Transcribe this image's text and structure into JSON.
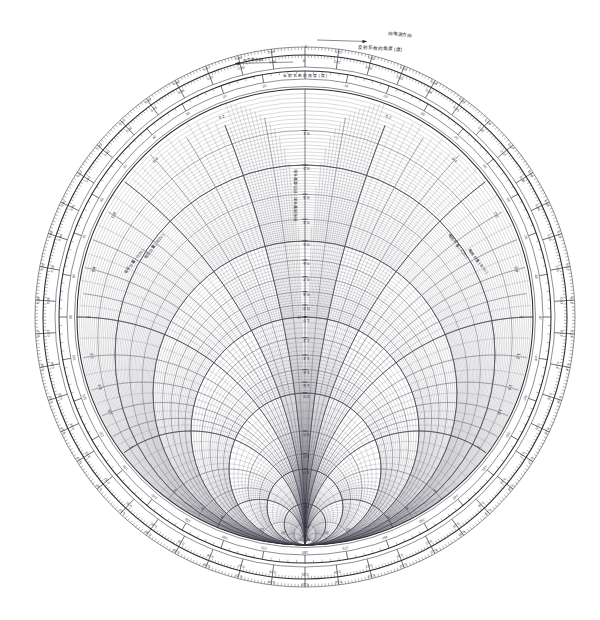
{
  "orientation": "rotated-90-ccw",
  "background_color": "#ffffff",
  "line_color": "#4a4a54",
  "rim_color": "#2a2a31",
  "geometry": {
    "center_x": 305,
    "center_y": 317,
    "chart_radius": 228,
    "ring_wavelength_outer_radius": 262,
    "ring_wavelength_inner_radius": 250,
    "ring_angle_radius": 238,
    "rotation_deg": -90
  },
  "annotations": {
    "top_scale_label": "反射系数的角度 (度)",
    "top_outer_arrow_label": "向电源方向",
    "top_inner_arrow_label": "向负载方向",
    "left_inner_label": "电阻分量 ( R/Zo ) 或 电导分量 ( G/Yo )",
    "right_inner_label": "电抗分量 ( X/Zo ) 或 电纳分量 ( B/Yo )",
    "center_origin": "O",
    "wavelength_outer_name": "向电源波长数",
    "wavelength_inner_name": "向负载波长数",
    "top_zero": "0",
    "top_left_val": "0.49",
    "top_right_val": "0.01"
  },
  "chart_data": {
    "type": "smith-chart",
    "normalization": "Zo = 1",
    "xlabel": "电阻分量 ( R/Zo )",
    "ylabel": "电抗分量 ( X/Zo )",
    "grid": true,
    "legend_position": "none",
    "resistance_circles_major": [
      0.1,
      0.2,
      0.3,
      0.4,
      0.5,
      0.6,
      0.7,
      0.8,
      0.9,
      1.0,
      1.2,
      1.4,
      1.6,
      1.8,
      2.0,
      3.0,
      4.0,
      5.0,
      10,
      20,
      50
    ],
    "resistance_circles_fine_bands": [
      {
        "from": 0.0,
        "to": 0.2,
        "step": 0.01
      },
      {
        "from": 0.2,
        "to": 0.5,
        "step": 0.01
      },
      {
        "from": 0.5,
        "to": 1.0,
        "step": 0.02
      },
      {
        "from": 1.0,
        "to": 2.0,
        "step": 0.05
      },
      {
        "from": 2.0,
        "to": 5.0,
        "step": 0.2
      },
      {
        "from": 5.0,
        "to": 20.0,
        "step": 1.0
      }
    ],
    "reactance_arcs_major": [
      0.1,
      0.2,
      0.3,
      0.4,
      0.5,
      0.6,
      0.7,
      0.8,
      0.9,
      1.0,
      1.2,
      1.4,
      1.6,
      1.8,
      2.0,
      3.0,
      4.0,
      5.0,
      10,
      20,
      50
    ],
    "axis_tick_labels": [
      "0.1",
      "0.2",
      "0.3",
      "0.4",
      "0.5",
      "0.6",
      "0.7",
      "0.8",
      "0.9",
      "1.0",
      "1.2",
      "1.4",
      "1.6",
      "1.8",
      "2.0",
      "3.0",
      "4.0",
      "5.0",
      "10",
      "20",
      "50"
    ],
    "reactance_labels_right": [
      "0.2",
      "0.4",
      "0.6",
      "0.8",
      "1.0",
      "1.2",
      "1.4",
      "1.6",
      "2.0",
      "3.0",
      "4.0",
      "5.0",
      "10",
      "20"
    ],
    "reactance_labels_left": [
      "0.2",
      "0.4",
      "0.6",
      "0.8",
      "1.0",
      "1.2",
      "1.4",
      "1.6",
      "2.0",
      "3.0",
      "4.0",
      "5.0",
      "10",
      "20"
    ],
    "angle_scale_deg": [
      0,
      10,
      20,
      30,
      40,
      50,
      60,
      70,
      80,
      90,
      100,
      110,
      120,
      130,
      140,
      150,
      160,
      170,
      180,
      -170,
      -160,
      -150,
      -140,
      -130,
      -120,
      -110,
      -100,
      -90,
      -80,
      -70,
      -60,
      -50,
      -40,
      -30,
      -20,
      -10
    ],
    "wavelength_scale_toward_generator": [
      "0.0",
      "0.01",
      "0.02",
      "0.03",
      "0.04",
      "0.05",
      "0.06",
      "0.07",
      "0.08",
      "0.09",
      "0.10",
      "0.11",
      "0.12",
      "0.13",
      "0.14",
      "0.15",
      "0.16",
      "0.17",
      "0.18",
      "0.19",
      "0.20",
      "0.21",
      "0.22",
      "0.23",
      "0.24",
      "0.25",
      "0.26",
      "0.27",
      "0.28",
      "0.29",
      "0.30",
      "0.31",
      "0.32",
      "0.33",
      "0.34",
      "0.35",
      "0.36",
      "0.37",
      "0.38",
      "0.39",
      "0.40",
      "0.41",
      "0.42",
      "0.43",
      "0.44",
      "0.45",
      "0.46",
      "0.47",
      "0.48",
      "0.49"
    ],
    "wavelength_scale_toward_load": [
      "0.0",
      "0.49",
      "0.48",
      "0.47",
      "0.46",
      "0.45",
      "0.44",
      "0.43",
      "0.42",
      "0.41",
      "0.40",
      "0.39",
      "0.38",
      "0.37",
      "0.36",
      "0.35",
      "0.34",
      "0.33",
      "0.32",
      "0.31",
      "0.30",
      "0.29",
      "0.28",
      "0.27",
      "0.26",
      "0.25",
      "0.24",
      "0.23",
      "0.22",
      "0.21",
      "0.20",
      "0.19",
      "0.18",
      "0.17",
      "0.16",
      "0.15",
      "0.14",
      "0.13",
      "0.12",
      "0.11",
      "0.10",
      "0.09",
      "0.08",
      "0.07",
      "0.06",
      "0.05",
      "0.04",
      "0.03",
      "0.02",
      "0.01"
    ]
  }
}
